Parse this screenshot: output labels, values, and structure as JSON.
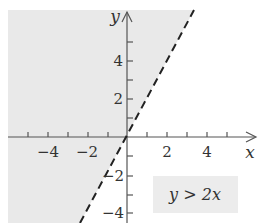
{
  "graph": {
    "inequality": "y > 2x",
    "boundary_line": "y = 2x",
    "boundary_style": "dashed",
    "shaded_side": "above-left",
    "x_axis_label": "x",
    "y_axis_label": "y",
    "x_tick_labels": [
      "−4",
      "−2",
      "2",
      "4"
    ],
    "y_tick_labels": [
      "4",
      "2",
      "−2",
      "−4"
    ],
    "colors": {
      "shade": "#e9e9e9",
      "axis": "#555555",
      "line": "#222222",
      "label_box": "#ececec"
    }
  }
}
